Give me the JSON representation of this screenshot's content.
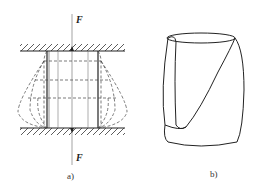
{
  "figure_a": {
    "caption": "a)",
    "force_top": "F",
    "force_bottom": "F"
  },
  "figure_b": {
    "caption": "b)"
  },
  "colors": {
    "line": "#222222",
    "background": "#ffffff"
  }
}
